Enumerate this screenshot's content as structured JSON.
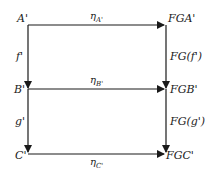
{
  "diagram": {
    "type": "commutative-square",
    "nodes": {
      "A": "A'",
      "B": "B'",
      "C": "C'",
      "FGA": "FGA'",
      "FGB": "FGB'",
      "FGC": "FGC'"
    },
    "arrows": {
      "etaA": {
        "symbol": "η",
        "sub": "A'"
      },
      "etaB": {
        "symbol": "η",
        "sub": "B'"
      },
      "etaC": {
        "symbol": "η",
        "sub": "C'"
      },
      "f": "f'",
      "g": "g'",
      "FGf": "FG(f')",
      "FGg": "FG(g')"
    },
    "colors": {
      "line": "#1a1a1a",
      "background": "#ffffff"
    }
  }
}
